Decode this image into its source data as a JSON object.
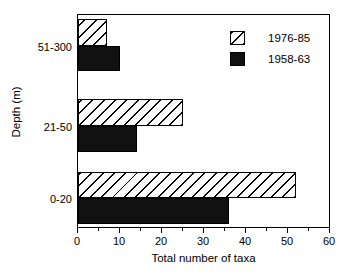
{
  "chart_data": {
    "type": "bar",
    "orientation": "horizontal",
    "title": "",
    "xlabel": "Total number of taxa",
    "ylabel": "Depth (m)",
    "categories": [
      "51-300",
      "21-50",
      "0-20"
    ],
    "series": [
      {
        "name": "1976-85",
        "style": "hatched",
        "values": [
          7,
          25,
          52
        ]
      },
      {
        "name": "1958-63",
        "style": "solid",
        "color": "#111111",
        "values": [
          10,
          14,
          36
        ]
      }
    ],
    "xlim": [
      0,
      60
    ],
    "xticks": [
      0,
      10,
      20,
      30,
      40,
      50,
      60
    ],
    "xtick_labels": [
      "0",
      "10",
      "20",
      "30",
      "40",
      "50",
      "60"
    ],
    "xminor_ticks": [
      5,
      15,
      25,
      35,
      45,
      55
    ],
    "ytick_labels": [
      "51-300",
      "21-50",
      "0-20"
    ],
    "grid": false,
    "legend_position": "top-right",
    "legend_entries": [
      "1976-85",
      "1958-63"
    ]
  },
  "axis": {
    "x_tick_0": "0",
    "x_tick_1": "10",
    "x_tick_2": "20",
    "x_tick_3": "30",
    "x_tick_4": "40",
    "x_tick_5": "50",
    "x_tick_6": "60",
    "y_tick_0": "51-300",
    "y_tick_1": "21-50",
    "y_tick_2": "0-20",
    "x_title": "Total number of taxa",
    "y_title": "Depth (m)"
  },
  "legend": {
    "entry_0_label": "1976-85",
    "entry_1_label": "1958-63"
  }
}
